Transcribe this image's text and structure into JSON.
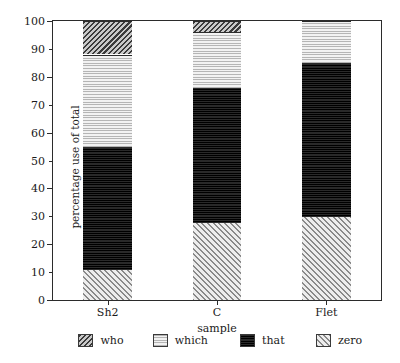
{
  "chart_data": {
    "type": "bar",
    "subtype": "stacked-bar-100-percent",
    "title": "",
    "xlabel": "sample",
    "ylabel": "percentage use of total",
    "categories": [
      "Sh2",
      "C",
      "Flet"
    ],
    "ylim": [
      0,
      100
    ],
    "ytick_step": 10,
    "yticks": [
      0,
      10,
      20,
      30,
      40,
      50,
      60,
      70,
      80,
      90,
      100
    ],
    "ytick_labels": [
      "0",
      "10",
      "20",
      "30",
      "40",
      "50",
      "60",
      "70",
      "80",
      "90",
      "100"
    ],
    "grid": false,
    "legend_position": "bottom",
    "stack_order_bottom_to_top": [
      "zero",
      "that",
      "which",
      "who"
    ],
    "series": [
      {
        "name": "who",
        "values": [
          12,
          4,
          0
        ]
      },
      {
        "name": "which",
        "values": [
          33,
          20,
          15
        ]
      },
      {
        "name": "that",
        "values": [
          44,
          48,
          55
        ]
      },
      {
        "name": "zero",
        "values": [
          11,
          28,
          30
        ]
      }
    ],
    "cumulative_tops": {
      "Sh2": {
        "zero": 11,
        "that": 55,
        "which": 88,
        "who": 100
      },
      "C": {
        "zero": 28,
        "that": 76,
        "which": 96,
        "who": 100
      },
      "Flet": {
        "zero": 30,
        "that": 85,
        "which": 100,
        "who": 100
      }
    },
    "legend": [
      {
        "label": "who",
        "pattern": "dark-diagonal-hatch",
        "color": "#6e6e6e"
      },
      {
        "label": "which",
        "pattern": "light-stipple",
        "color": "#e6e6e6"
      },
      {
        "label": "that",
        "pattern": "dense-black-grid",
        "color": "#151515"
      },
      {
        "label": "zero",
        "pattern": "light-diagonal-hatch",
        "color": "#d2d2d2"
      }
    ],
    "axis_color": "#2b2b2b",
    "background_color": "#ffffff"
  },
  "axes": {
    "x_title": "sample",
    "y_title": "percentage use of total"
  }
}
